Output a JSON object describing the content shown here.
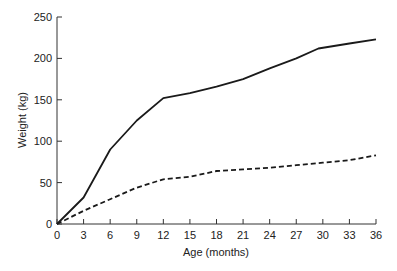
{
  "chart_data": {
    "type": "line",
    "title": "",
    "xlabel": "Age (months)",
    "ylabel": "Weight (kg)",
    "xlim": [
      0,
      36
    ],
    "ylim": [
      0,
      250
    ],
    "x_ticks": [
      0,
      3,
      6,
      9,
      12,
      15,
      18,
      21,
      24,
      27,
      30,
      33,
      36
    ],
    "y_ticks": [
      0,
      50,
      100,
      150,
      200,
      250
    ],
    "grid": false,
    "legend": null,
    "series": [
      {
        "name": "solid",
        "style": "solid",
        "x": [
          0,
          3,
          6,
          9,
          12,
          15,
          18,
          21,
          24,
          27,
          29.5,
          33,
          36
        ],
        "values": [
          0,
          32,
          90,
          125,
          152,
          158,
          166,
          175,
          188,
          200,
          212,
          218,
          223
        ]
      },
      {
        "name": "dashed",
        "style": "dashed",
        "x": [
          0,
          3,
          6,
          9,
          12,
          15,
          18,
          21,
          24,
          27,
          30,
          33,
          36
        ],
        "values": [
          0,
          16,
          30,
          44,
          54,
          57,
          64,
          66,
          68,
          71,
          74,
          77,
          83
        ]
      }
    ]
  }
}
